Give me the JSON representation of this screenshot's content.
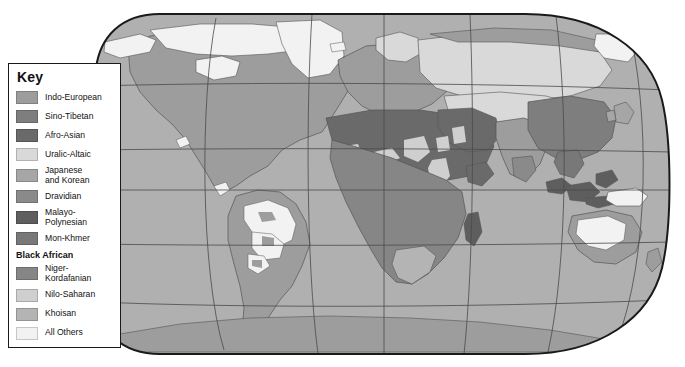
{
  "map": {
    "title_visible": false,
    "projection": "robinson-oval",
    "graticule_visible": true,
    "colors": {
      "outside": "#ffffff",
      "ocean": "#b0b0b0",
      "frame_stroke": "#1a1a1a",
      "graticule_stroke": "#4a4a4a",
      "coastline_stroke": "#555555",
      "indo_european": "#9d9d9d",
      "sino_tibetan": "#7e7e7e",
      "afro_asian": "#6a6a6a",
      "uralic_altaic": "#d9d9d9",
      "japanese_korean": "#a6a6a6",
      "dravidian": "#8a8a8a",
      "malayo_polynesian": "#5e5e5e",
      "mon_khmer": "#787878",
      "niger_kordafanian": "#868686",
      "nilo_saharan": "#cfcfcf",
      "khoisan": "#b4b4b4",
      "all_others": "#f2f2f2"
    }
  },
  "legend": {
    "title": "Key",
    "items": [
      {
        "label": "Indo-European",
        "color": "#9d9d9d",
        "name": "indo-european"
      },
      {
        "label": "Sino-Tibetan",
        "color": "#7e7e7e",
        "name": "sino-tibetan"
      },
      {
        "label": "Afro-Asian",
        "color": "#6a6a6a",
        "name": "afro-asian"
      },
      {
        "label": "Uralic-Altaic",
        "color": "#d9d9d9",
        "name": "uralic-altaic"
      },
      {
        "label": "Japanese\nand Korean",
        "color": "#a6a6a6",
        "name": "japanese-and-korean"
      },
      {
        "label": "Dravidian",
        "color": "#8a8a8a",
        "name": "dravidian"
      },
      {
        "label": "Malayo-\nPolynesian",
        "color": "#5e5e5e",
        "name": "malayo-polynesian"
      },
      {
        "label": "Mon-Khmer",
        "color": "#787878",
        "name": "mon-khmer"
      }
    ],
    "group_heading": "Black African",
    "group_items": [
      {
        "label": "Niger-\nKordafanian",
        "color": "#868686",
        "name": "niger-kordafanian"
      },
      {
        "label": "Nilo-Saharan",
        "color": "#cfcfcf",
        "name": "nilo-saharan"
      },
      {
        "label": "Khoisan",
        "color": "#b4b4b4",
        "name": "khoisan"
      }
    ],
    "trailing_items": [
      {
        "label": "All Others",
        "color": "#f2f2f2",
        "name": "all-others"
      }
    ]
  }
}
